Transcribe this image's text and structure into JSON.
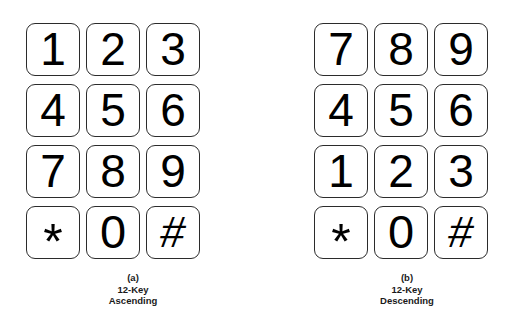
{
  "figure": {
    "background_color": "#ffffff",
    "key_border_color": "#2b2b2b",
    "key_fill_color": "#ffffff",
    "label_color": "#000000"
  },
  "panels": [
    {
      "id": "keypad-ascending",
      "caption": {
        "index": "(a)",
        "line1": "12-Key",
        "line2": "Ascending"
      },
      "rows": [
        [
          {
            "label": "1",
            "name": "key-1",
            "kind": "digit"
          },
          {
            "label": "2",
            "name": "key-2",
            "kind": "digit"
          },
          {
            "label": "3",
            "name": "key-3",
            "kind": "digit"
          }
        ],
        [
          {
            "label": "4",
            "name": "key-4",
            "kind": "digit"
          },
          {
            "label": "5",
            "name": "key-5",
            "kind": "digit"
          },
          {
            "label": "6",
            "name": "key-6",
            "kind": "digit"
          }
        ],
        [
          {
            "label": "7",
            "name": "key-7",
            "kind": "digit"
          },
          {
            "label": "8",
            "name": "key-8",
            "kind": "digit"
          },
          {
            "label": "9",
            "name": "key-9",
            "kind": "digit"
          }
        ],
        [
          {
            "label": "*",
            "name": "key-star",
            "kind": "star"
          },
          {
            "label": "0",
            "name": "key-0",
            "kind": "zero"
          },
          {
            "label": "#",
            "name": "key-hash",
            "kind": "hash"
          }
        ]
      ]
    },
    {
      "id": "keypad-descending",
      "caption": {
        "index": "(b)",
        "line1": "12-Key",
        "line2": "Descending"
      },
      "rows": [
        [
          {
            "label": "7",
            "name": "key-7",
            "kind": "digit"
          },
          {
            "label": "8",
            "name": "key-8",
            "kind": "digit"
          },
          {
            "label": "9",
            "name": "key-9",
            "kind": "digit"
          }
        ],
        [
          {
            "label": "4",
            "name": "key-4",
            "kind": "digit"
          },
          {
            "label": "5",
            "name": "key-5",
            "kind": "digit"
          },
          {
            "label": "6",
            "name": "key-6",
            "kind": "digit"
          }
        ],
        [
          {
            "label": "1",
            "name": "key-1",
            "kind": "digit"
          },
          {
            "label": "2",
            "name": "key-2",
            "kind": "digit"
          },
          {
            "label": "3",
            "name": "key-3",
            "kind": "digit"
          }
        ],
        [
          {
            "label": "*",
            "name": "key-star",
            "kind": "star"
          },
          {
            "label": "0",
            "name": "key-0",
            "kind": "zero"
          },
          {
            "label": "#",
            "name": "key-hash",
            "kind": "hash"
          }
        ]
      ]
    }
  ]
}
